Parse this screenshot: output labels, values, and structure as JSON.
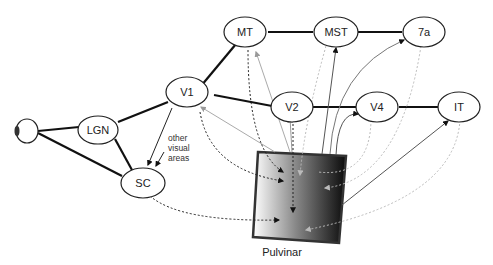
{
  "diagram": {
    "nodes": {
      "eye": {
        "label": ""
      },
      "lgn": {
        "label": "LGN"
      },
      "sc": {
        "label": "SC"
      },
      "v1": {
        "label": "V1"
      },
      "mt": {
        "label": "MT"
      },
      "mst": {
        "label": "MST"
      },
      "seven_a": {
        "label": "7a"
      },
      "v2": {
        "label": "V2"
      },
      "v4": {
        "label": "V4"
      },
      "it": {
        "label": "IT"
      }
    },
    "annotation": {
      "line1": "other",
      "line2": "visual",
      "line3": "areas"
    },
    "pulvinar": {
      "label": "Pulvinar"
    },
    "colors": {
      "forward_solid": "#111111",
      "feedforward_gray": "#9a9a9a",
      "dotted_dark": "#222222",
      "dotted_light": "#b5b5b5"
    },
    "edges_solid": [
      [
        "eye",
        "lgn"
      ],
      [
        "eye",
        "sc"
      ],
      [
        "lgn",
        "v1"
      ],
      [
        "lgn",
        "sc"
      ],
      [
        "v1",
        "mt"
      ],
      [
        "v1",
        "v2"
      ],
      [
        "mt",
        "mst"
      ],
      [
        "mst",
        "seven_a"
      ],
      [
        "v2",
        "v4"
      ],
      [
        "v4",
        "it"
      ]
    ]
  }
}
